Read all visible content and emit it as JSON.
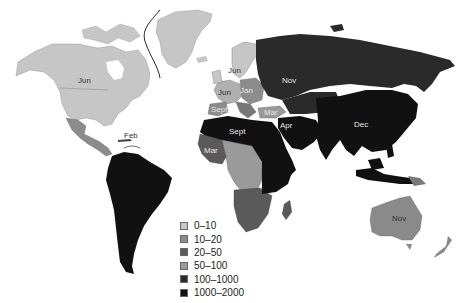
{
  "map": {
    "title": "",
    "background": "#ffffff",
    "colors": {
      "c0_10": "#c6c6c6",
      "c10_20": "#8c8c8c",
      "c20_50": "#5a5a5a",
      "c50_100": "#9a9a9a",
      "c100_1000": "#2a2a2a",
      "c1000_2000": "#111111",
      "greenland_line": "#222222"
    },
    "regions": [
      {
        "id": "north-america",
        "label": "Jun",
        "category": "0-10"
      },
      {
        "id": "caribbean",
        "label": "Feb",
        "category": "0-10"
      },
      {
        "id": "central-america",
        "label": "",
        "category": "10-20"
      },
      {
        "id": "south-america",
        "label": "",
        "category": "1000-2000"
      },
      {
        "id": "scandinavia",
        "label": "Jun",
        "category": "0-10"
      },
      {
        "id": "western-europe",
        "label": "Jun",
        "category": "0-10"
      },
      {
        "id": "eastern-europe",
        "label": "Jan",
        "category": "10-20"
      },
      {
        "id": "iberia",
        "label": "Sept",
        "category": "10-20"
      },
      {
        "id": "turkey",
        "label": "Mar",
        "category": "50-100"
      },
      {
        "id": "russia",
        "label": "Nov",
        "category": "100-1000"
      },
      {
        "id": "north-africa",
        "label": "Sept",
        "category": "1000-2000"
      },
      {
        "id": "west-africa",
        "label": "Mar",
        "category": "20-50"
      },
      {
        "id": "middle-east",
        "label": "Apr",
        "category": "1000-2000"
      },
      {
        "id": "east-asia",
        "label": "Dec",
        "category": "1000-2000"
      },
      {
        "id": "australia",
        "label": "Nov",
        "category": "20-50"
      }
    ]
  },
  "labels": {
    "north_america": "Jun",
    "caribbean": "Feb",
    "scandinavia": "Jun",
    "west_europe": "Jun",
    "east_europe": "Jan",
    "iberia": "Sept",
    "turkey": "Mar",
    "russia": "Nov",
    "north_africa": "Sept",
    "west_africa": "Mar",
    "middle_east": "Apr",
    "east_asia": "Dec",
    "australia": "Nov"
  },
  "legend": {
    "items": [
      {
        "label": "0–10",
        "color": "#c6c6c6"
      },
      {
        "label": "10–20",
        "color": "#8c8c8c"
      },
      {
        "label": "20–50",
        "color": "#5a5a5a"
      },
      {
        "label": "50–100",
        "color": "#9a9a9a"
      },
      {
        "label": "100–1000",
        "color": "#2a2a2a"
      },
      {
        "label": "1000–2000",
        "color": "#111111"
      }
    ]
  }
}
